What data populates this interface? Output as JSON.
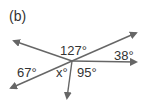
{
  "figure": {
    "label": "(b)",
    "colors": {
      "line": "#666666",
      "text": "#333333"
    },
    "vertex": {
      "x": 72,
      "y": 61
    },
    "rays": [
      {
        "name": "upper-left",
        "end": [
          13,
          41
        ]
      },
      {
        "name": "upper-right",
        "end": [
          137,
          33
        ]
      },
      {
        "name": "right",
        "end": [
          137,
          62
        ]
      },
      {
        "name": "lower-left",
        "end": [
          10,
          89
        ]
      },
      {
        "name": "down",
        "end": [
          67,
          99
        ]
      }
    ],
    "angles": {
      "top": "127°",
      "right": "38°",
      "left": "67°",
      "unknown": "x°",
      "bottom_right": "95°"
    }
  }
}
